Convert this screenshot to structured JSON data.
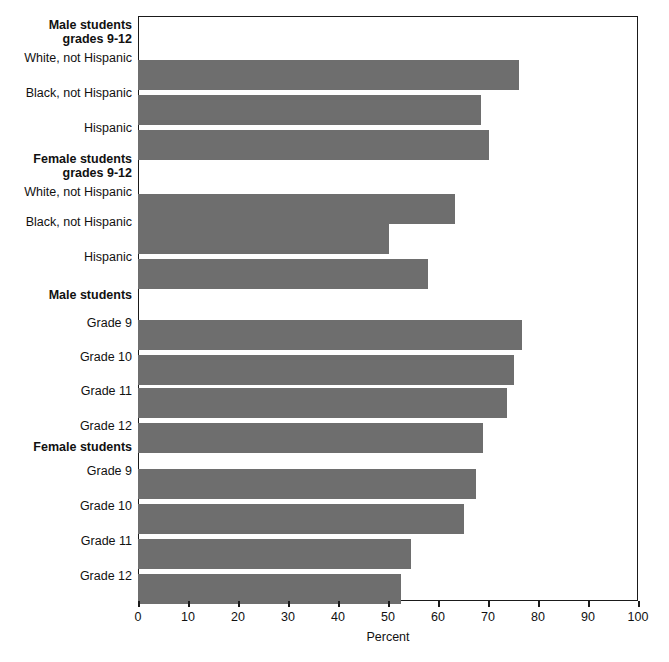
{
  "figure": {
    "background_color": "#ffffff",
    "bar_color": "#6e6e6e",
    "axis_color": "#1a1a1a"
  },
  "chart_data": {
    "type": "bar",
    "orientation": "horizontal",
    "title": "",
    "xlabel": "Percent",
    "ylabel": "",
    "xlim": [
      0,
      100
    ],
    "xticks": [
      0,
      10,
      20,
      30,
      40,
      50,
      60,
      70,
      80,
      90,
      100
    ],
    "xtick_labels": [
      "0",
      "10",
      "20",
      "30",
      "40",
      "50",
      "60",
      "70",
      "80",
      "90",
      "100"
    ],
    "grid": false,
    "legend": null,
    "groups": [
      {
        "group_label": "Male students\ngrades 9-12",
        "categories": [
          "White, not Hispanic",
          "Black, not Hispanic",
          "Hispanic"
        ],
        "values": [
          76.2,
          68.6,
          70.2
        ]
      },
      {
        "group_label": "Female students\ngrades 9-12",
        "categories": [
          "White, not Hispanic",
          "Black, not Hispanic",
          "Hispanic"
        ],
        "values": [
          63.4,
          50.2,
          58.0
        ]
      },
      {
        "group_label": "Male students",
        "categories": [
          "Grade 9",
          "Grade 10",
          "Grade 11",
          "Grade 12"
        ],
        "values": [
          76.8,
          75.2,
          73.8,
          69.0
        ]
      },
      {
        "group_label": "Female students",
        "categories": [
          "Grade 9",
          "Grade 10",
          "Grade 11",
          "Grade 12"
        ],
        "values": [
          67.6,
          65.2,
          54.6,
          52.6
        ]
      }
    ],
    "categories": [
      "White, not Hispanic",
      "Black, not Hispanic",
      "Hispanic",
      "White, not Hispanic",
      "Black, not Hispanic",
      "Hispanic",
      "Grade 9",
      "Grade 10",
      "Grade 11",
      "Grade 12",
      "Grade 9",
      "Grade 10",
      "Grade 11",
      "Grade 12"
    ],
    "values": [
      76.2,
      68.6,
      70.2,
      63.4,
      50.2,
      58.0,
      76.8,
      75.2,
      73.8,
      69.0,
      67.6,
      65.2,
      54.6,
      52.6
    ]
  },
  "rows": [
    {
      "kind": "group",
      "label": "Male students\ngrades 9-12",
      "top": 18,
      "bar_top": null,
      "value": null
    },
    {
      "kind": "bar",
      "label": "White, not Hispanic",
      "top": 51,
      "bar_top": 44,
      "value": 76.2
    },
    {
      "kind": "bar",
      "label": "Black, not Hispanic",
      "top": 86,
      "bar_top": 79,
      "value": 68.6
    },
    {
      "kind": "bar",
      "label": "Hispanic",
      "top": 121,
      "bar_top": 114,
      "value": 70.2
    },
    {
      "kind": "group",
      "label": "Female students\ngrades 9-12",
      "top": 152,
      "bar_top": null,
      "value": null
    },
    {
      "kind": "bar",
      "label": "White, not Hispanic",
      "top": 185,
      "bar_top": 178,
      "value": 63.4
    },
    {
      "kind": "bar",
      "label": "Black, not Hispanic",
      "top": 215,
      "bar_top": 208,
      "value": 50.2
    },
    {
      "kind": "bar",
      "label": "Hispanic",
      "top": 250,
      "bar_top": 243,
      "value": 58.0
    },
    {
      "kind": "group",
      "label": "Male students",
      "top": 288,
      "bar_top": null,
      "value": null
    },
    {
      "kind": "bar",
      "label": "Grade 9",
      "top": 316,
      "bar_top": 304,
      "value": 76.8
    },
    {
      "kind": "bar",
      "label": "Grade 10",
      "top": 350,
      "bar_top": 339,
      "value": 75.2
    },
    {
      "kind": "bar",
      "label": "Grade 11",
      "top": 384,
      "bar_top": 372,
      "value": 73.8
    },
    {
      "kind": "bar",
      "label": "Grade 12",
      "top": 419,
      "bar_top": 407,
      "value": 69.0
    },
    {
      "kind": "group",
      "label": "Female students",
      "top": 440,
      "bar_top": null,
      "value": null
    },
    {
      "kind": "bar",
      "label": "Grade 9",
      "top": 464,
      "bar_top": 453,
      "value": 67.6
    },
    {
      "kind": "bar",
      "label": "Grade 10",
      "top": 499,
      "bar_top": 488,
      "value": 65.2
    },
    {
      "kind": "bar",
      "label": "Grade 11",
      "top": 534,
      "bar_top": 523,
      "value": 54.6
    },
    {
      "kind": "bar",
      "label": "Grade 12",
      "top": 569,
      "bar_top": 558,
      "value": 52.6
    }
  ]
}
